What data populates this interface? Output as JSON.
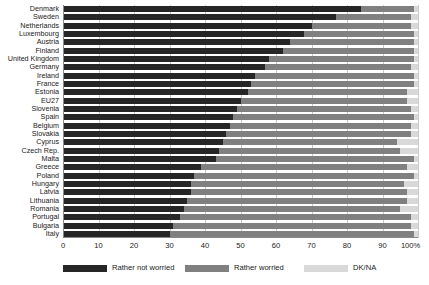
{
  "chart_data": {
    "type": "bar",
    "orientation": "horizontal",
    "stacked": true,
    "stack_total": 100,
    "title": "",
    "subtitle": "",
    "xlabel": "",
    "ylabel": "",
    "xlim": [
      0,
      100
    ],
    "xticks": [
      0,
      10,
      20,
      30,
      40,
      50,
      60,
      70,
      80,
      90,
      100
    ],
    "xtick_labels": [
      "0",
      "10",
      "20",
      "30",
      "40",
      "50",
      "60",
      "70",
      "80",
      "90",
      "100%"
    ],
    "grid": true,
    "grid_axis": "x",
    "legend_position": "bottom",
    "categories": [
      "Denmark",
      "Sweden",
      "Netherlands",
      "Luxembourg",
      "Austria",
      "Finland",
      "United Kingdom",
      "Germany",
      "Ireland",
      "France",
      "Estonia",
      "EU27",
      "Slovenia",
      "Spain",
      "Belgium",
      "Slovakia",
      "Cyprus",
      "Czech Rep.",
      "Malta",
      "Greece",
      "Poland",
      "Hungary",
      "Latvia",
      "Lithuania",
      "Romania",
      "Portugal",
      "Bulgaria",
      "Italy"
    ],
    "series": [
      {
        "name": "Rather not worried",
        "color": "#262626",
        "values": [
          84,
          77,
          70,
          68,
          64,
          62,
          58,
          57,
          54,
          53,
          52,
          50,
          49,
          48,
          47,
          46,
          45,
          44,
          43,
          39,
          37,
          36,
          36,
          35,
          34,
          33,
          31,
          30
        ]
      },
      {
        "name": "Rather worried",
        "color": "#808080",
        "values": [
          15,
          21,
          28,
          31,
          35,
          37,
          41,
          41,
          45,
          46,
          45,
          47,
          49,
          51,
          51,
          52,
          49,
          51,
          56,
          58,
          62,
          60,
          61,
          62,
          61,
          65,
          67,
          69
        ]
      },
      {
        "name": "DK/NA",
        "color": "#d9d9d9",
        "values": [
          1,
          2,
          2,
          1,
          1,
          1,
          1,
          2,
          1,
          1,
          3,
          3,
          2,
          1,
          2,
          2,
          6,
          5,
          1,
          3,
          1,
          4,
          3,
          3,
          5,
          2,
          2,
          1
        ]
      }
    ],
    "legend": [
      {
        "label": "Rather not worried",
        "color": "#262626"
      },
      {
        "label": "Rather worried",
        "color": "#808080"
      },
      {
        "label": "DK/NA",
        "color": "#d9d9d9"
      }
    ]
  }
}
